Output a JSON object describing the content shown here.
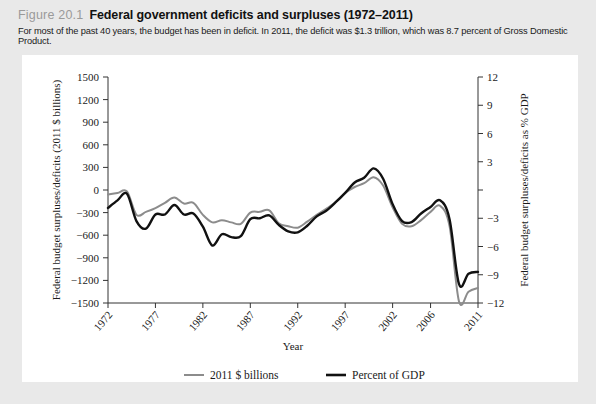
{
  "figure": {
    "label": "Figure 20.1",
    "title": "Federal government deficits and surpluses (1972–2011)",
    "subtitle": "For most of the past 40 years, the budget has been in deficit. In 2011, the deficit was $1.3 trillion, which was 8.7 percent of Gross Domestic Product."
  },
  "colors": {
    "page_background": "#e9e9e9",
    "plate_background": "#ffffff",
    "series_dollars": "#8c8c8c",
    "series_gdp": "#111111",
    "axis": "#333333",
    "label_gray": "#9a9a9a"
  },
  "chart_data": {
    "type": "line",
    "title": "Federal government deficits and surpluses (1972–2011)",
    "xlabel": "Year",
    "ylabel": "Federal budget surpluses/deficits (2011 $ billions)",
    "y2label": "Federal budget surpluses/deficits as % GDP",
    "xlim": [
      1972,
      2011
    ],
    "ylim": [
      -1500,
      1500
    ],
    "y2lim": [
      -12,
      12
    ],
    "yticks": [
      1500,
      1200,
      900,
      600,
      300,
      0,
      -300,
      -600,
      -900,
      -1200,
      -1500
    ],
    "ytick_labels": [
      "1500",
      "1200",
      "900",
      "600",
      "300",
      "0",
      "−300",
      "−600",
      "−900",
      "−1200",
      "−1500"
    ],
    "y2ticks": [
      12,
      9,
      6,
      3,
      0,
      -3,
      -6,
      -9,
      -12
    ],
    "y2tick_labels": [
      "12",
      "9",
      "6",
      "3",
      "",
      "−3",
      "−6",
      "−9",
      "−12"
    ],
    "xticks": [
      1972,
      1977,
      1982,
      1987,
      1992,
      1997,
      2002,
      2006,
      2011
    ],
    "xtick_labels": [
      "1972",
      "1977",
      "1982",
      "1987",
      "1992",
      "1997",
      "2002",
      "2006",
      "2011"
    ],
    "grid": false,
    "legend_position": "bottom",
    "legend": [
      "2011 $ billions",
      "Percent of GDP"
    ],
    "x": [
      1972,
      1973,
      1974,
      1975,
      1976,
      1977,
      1978,
      1979,
      1980,
      1981,
      1982,
      1983,
      1984,
      1985,
      1986,
      1987,
      1988,
      1989,
      1990,
      1991,
      1992,
      1993,
      1994,
      1995,
      1996,
      1997,
      1998,
      1999,
      2000,
      2001,
      2002,
      2003,
      2004,
      2005,
      2006,
      2007,
      2008,
      2009,
      2010,
      2011
    ],
    "series": [
      {
        "name": "2011 $ billions",
        "color": "#8c8c8c",
        "axis": "left",
        "values": [
          -60,
          -40,
          -20,
          -330,
          -290,
          -240,
          -170,
          -100,
          -180,
          -170,
          -330,
          -430,
          -400,
          -430,
          -450,
          -300,
          -290,
          -270,
          -440,
          -480,
          -500,
          -420,
          -330,
          -250,
          -160,
          -40,
          40,
          90,
          170,
          60,
          -230,
          -450,
          -480,
          -400,
          -290,
          -210,
          -480,
          -1480,
          -1350,
          -1300
        ]
      },
      {
        "name": "Percent of GDP",
        "color": "#111111",
        "axis": "right",
        "values": [
          -1.9,
          -1.1,
          -0.4,
          -3.3,
          -4.1,
          -2.6,
          -2.6,
          -1.6,
          -2.6,
          -2.5,
          -3.9,
          -5.9,
          -4.7,
          -5.0,
          -4.9,
          -3.1,
          -3.0,
          -2.7,
          -3.7,
          -4.4,
          -4.5,
          -3.8,
          -2.8,
          -2.2,
          -1.3,
          -0.3,
          0.8,
          1.3,
          2.3,
          1.2,
          -1.5,
          -3.3,
          -3.4,
          -2.5,
          -1.8,
          -1.1,
          -3.1,
          -10.0,
          -8.9,
          -8.7
        ]
      }
    ]
  }
}
